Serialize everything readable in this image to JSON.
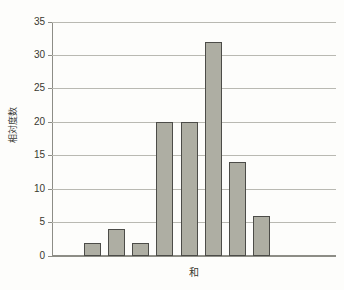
{
  "chart_data": {
    "type": "bar",
    "title": "",
    "xlabel": "和",
    "ylabel": "相対度数",
    "categories": [
      "",
      "",
      "",
      "",
      "",
      "",
      "",
      ""
    ],
    "values": [
      2,
      4,
      2,
      20,
      20,
      32,
      14,
      6
    ],
    "ylim": [
      0,
      35
    ],
    "ytick_values": [
      0,
      5,
      10,
      15,
      20,
      25,
      30,
      35
    ],
    "ytick_labels": [
      "0",
      "5",
      "10",
      "15",
      "20",
      "25",
      "30",
      "35"
    ],
    "xtick_labels": [],
    "grid": true,
    "legend": null,
    "bar_color": "#aeaea3",
    "bar_edge_color": "#4c4c48",
    "grid_color": "#b9b9b2",
    "axis_color": "#8d8d86",
    "background_color": "#fdfdfb"
  }
}
